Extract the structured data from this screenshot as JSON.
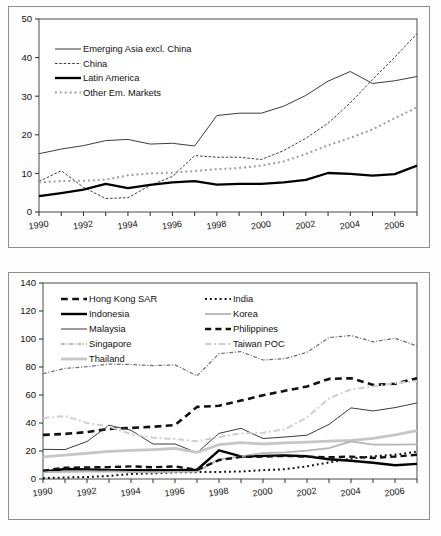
{
  "figure": {
    "background": "#fdfdfd",
    "frame_color": "#8d8d8d",
    "axis_color": "#2b2b2b"
  },
  "chart_data": [
    {
      "id": "top",
      "type": "line",
      "title": "",
      "subtitle": "",
      "xlabel": "",
      "ylabel": "",
      "grid": false,
      "legend_position": "upper-left",
      "xlim": [
        1990,
        2007
      ],
      "ylim": [
        0,
        50
      ],
      "yticks": [
        0,
        10,
        20,
        30,
        40,
        50
      ],
      "xticks": [
        1990,
        1992,
        1994,
        1996,
        1998,
        2000,
        2002,
        2004,
        2006
      ],
      "x": [
        1990,
        1991,
        1992,
        1993,
        1994,
        1995,
        1996,
        1997,
        1998,
        1999,
        2000,
        2001,
        2002,
        2003,
        2004,
        2005,
        2006,
        2007
      ],
      "series": [
        {
          "name": "Emerging Asia excl. China",
          "style": "solid",
          "color": "#3c3c3c",
          "width": 1.0,
          "values": [
            15.1,
            16.3,
            17.2,
            18.5,
            18.8,
            17.6,
            17.8,
            17.1,
            25.0,
            25.6,
            25.6,
            27.4,
            30.2,
            33.9,
            36.4,
            33.3,
            34.0,
            35.1
          ]
        },
        {
          "name": "China",
          "style": "dashed",
          "color": "#3c3c3c",
          "width": 1.0,
          "values": [
            7.9,
            10.7,
            6.4,
            3.5,
            3.7,
            6.9,
            9.2,
            14.6,
            14.2,
            14.2,
            13.6,
            15.9,
            19.1,
            23.0,
            28.3,
            34.3,
            40.1,
            46.2
          ]
        },
        {
          "name": "Latin America",
          "style": "solid",
          "color": "#000000",
          "width": 2.3,
          "values": [
            4.1,
            4.9,
            5.8,
            7.3,
            6.2,
            7.0,
            7.7,
            8.0,
            7.1,
            7.3,
            7.3,
            7.7,
            8.3,
            10.1,
            9.9,
            9.4,
            9.8,
            12.0
          ]
        },
        {
          "name": "Other Em. Markets",
          "style": "dotted",
          "color": "#9b9b9b",
          "width": 2.0,
          "values": [
            7.7,
            8.0,
            8.1,
            8.4,
            9.5,
            10.0,
            10.2,
            10.6,
            11.1,
            11.4,
            12.0,
            13.1,
            15.0,
            17.3,
            19.2,
            21.4,
            24.3,
            27.1
          ]
        }
      ]
    },
    {
      "id": "bottom",
      "type": "line",
      "title": "",
      "subtitle": "",
      "xlabel": "",
      "ylabel": "",
      "grid": false,
      "legend_position": "upper-left",
      "xlim": [
        1990,
        2007
      ],
      "ylim": [
        0,
        140
      ],
      "yticks": [
        0,
        20,
        40,
        60,
        80,
        100,
        120,
        140
      ],
      "xticks": [
        1990,
        1992,
        1994,
        1996,
        1998,
        2000,
        2002,
        2004,
        2006
      ],
      "x": [
        1990,
        1991,
        1992,
        1993,
        1994,
        1995,
        1996,
        1997,
        1998,
        1999,
        2000,
        2001,
        2002,
        2003,
        2004,
        2005,
        2006,
        2007
      ],
      "series": [
        {
          "name": "Hong Kong SAR",
          "style": "dashed",
          "color": "#111111",
          "width": 2.6,
          "values": [
            31.5,
            32.2,
            33.5,
            35.8,
            36.5,
            37.3,
            38.5,
            51.5,
            52.3,
            56.0,
            59.8,
            63.0,
            66.1,
            71.5,
            72.0,
            67.2,
            68.0,
            72.0
          ]
        },
        {
          "name": "Indonesia",
          "style": "solid",
          "color": "#000000",
          "width": 2.4,
          "values": [
            5.2,
            7.1,
            6.9,
            6.4,
            6.3,
            6.2,
            6.3,
            6.6,
            20.5,
            16.1,
            16.5,
            16.9,
            16.2,
            14.1,
            13.0,
            11.6,
            9.8,
            10.8
          ]
        },
        {
          "name": "Malaysia",
          "style": "solid",
          "color": "#3c3c3c",
          "width": 1.0,
          "values": [
            21.2,
            21.0,
            26.8,
            38.4,
            34.8,
            25.0,
            25.0,
            18.8,
            32.6,
            36.2,
            28.9,
            30.0,
            31.3,
            39.0,
            50.8,
            48.6,
            51.0,
            54.3
          ]
        },
        {
          "name": "Singapore",
          "style": "dashdot",
          "color": "#6e6e6e",
          "width": 1.2,
          "values": [
            75.2,
            79.0,
            80.2,
            82.1,
            81.8,
            81.0,
            81.5,
            73.6,
            89.5,
            91.0,
            85.0,
            86.0,
            90.5,
            101.0,
            102.5,
            98.0,
            100.5,
            95.0
          ]
        },
        {
          "name": "Thailand",
          "style": "solid",
          "color": "#c6c6c6",
          "width": 2.8,
          "values": [
            15.8,
            17.0,
            18.4,
            19.8,
            20.5,
            21.0,
            21.8,
            19.0,
            24.5,
            26.0,
            25.0,
            25.8,
            26.3,
            27.0,
            27.5,
            29.0,
            31.5,
            34.5
          ]
        },
        {
          "name": "India",
          "style": "dotted",
          "color": "#111111",
          "width": 2.0,
          "values": [
            0.6,
            1.1,
            1.4,
            2.2,
            3.6,
            4.0,
            4.8,
            4.9,
            5.0,
            5.4,
            6.3,
            7.0,
            9.1,
            11.8,
            14.6,
            16.2,
            17.3,
            19.5
          ]
        },
        {
          "name": "Korea",
          "style": "solid",
          "color": "#b5b5b5",
          "width": 1.8,
          "values": [
            5.0,
            5.1,
            5.2,
            5.4,
            5.0,
            4.8,
            5.1,
            5.3,
            14.0,
            16.2,
            18.5,
            19.0,
            20.2,
            22.0,
            26.8,
            24.6,
            24.5,
            24.8
          ]
        },
        {
          "name": "Philippines",
          "style": "dashed",
          "color": "#111111",
          "width": 2.4,
          "values": [
            6.0,
            8.0,
            8.3,
            8.5,
            9.0,
            8.4,
            9.0,
            6.5,
            13.5,
            15.8,
            16.0,
            16.5,
            16.0,
            15.5,
            16.0,
            15.0,
            16.0,
            17.3
          ]
        },
        {
          "name": "Taiwan POC",
          "style": "dashdot",
          "color": "#cfcfcf",
          "width": 2.0,
          "values": [
            43.5,
            45.0,
            40.0,
            37.5,
            32.0,
            29.5,
            28.5,
            27.0,
            30.0,
            32.5,
            33.0,
            35.5,
            44.0,
            57.5,
            64.0,
            66.0,
            68.5,
            70.0
          ]
        }
      ]
    }
  ],
  "top_chart": {
    "legend": [
      {
        "label": "Emerging Asia excl. China"
      },
      {
        "label": "China"
      },
      {
        "label": "Latin America"
      },
      {
        "label": "Other Em. Markets"
      }
    ]
  },
  "bottom_chart": {
    "legend_col1": [
      {
        "label": "Hong Kong SAR"
      },
      {
        "label": "Indonesia"
      },
      {
        "label": "Malaysia"
      },
      {
        "label": "Singapore"
      },
      {
        "label": "Thailand"
      }
    ],
    "legend_col2": [
      {
        "label": "India"
      },
      {
        "label": "Korea"
      },
      {
        "label": "Philippines"
      },
      {
        "label": "Taiwan POC"
      }
    ]
  }
}
